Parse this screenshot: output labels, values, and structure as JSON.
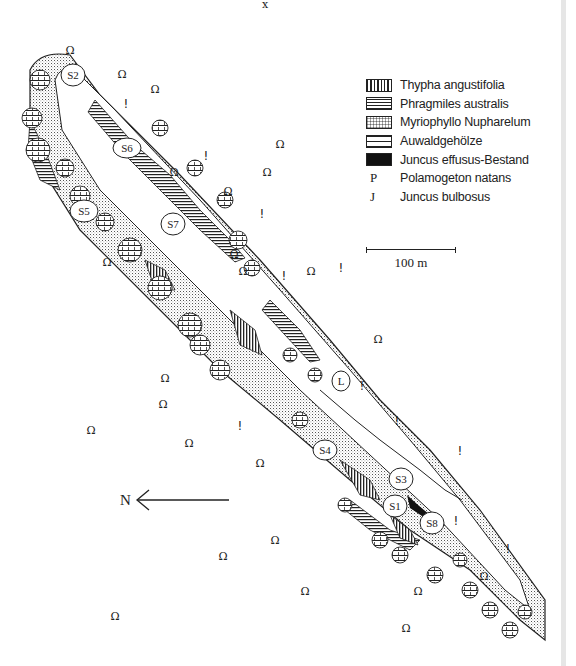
{
  "legend": {
    "items": [
      {
        "type": "pattern",
        "pattern": "vertical-hatch",
        "label": "Thypha angustifolia"
      },
      {
        "type": "pattern",
        "pattern": "horizontal-hatch",
        "label": "Phragmiles australis"
      },
      {
        "type": "pattern",
        "pattern": "fine-dots",
        "label": "Myriophyllo Nupharelum"
      },
      {
        "type": "pattern",
        "pattern": "wide-horizontal",
        "label": "Auwaldgehölze"
      },
      {
        "type": "pattern",
        "pattern": "solid-black",
        "label": "Juncus effusus-Bestand"
      },
      {
        "type": "symbol",
        "symbol": "P",
        "label": "Polamogeton natans"
      },
      {
        "type": "symbol",
        "symbol": "J",
        "label": "Juncus bulbosus"
      }
    ]
  },
  "scale": {
    "label": "100 m"
  },
  "north_arrow": {
    "label": "N"
  },
  "sites": [
    {
      "id": "S2",
      "x": 73,
      "y": 75
    },
    {
      "id": "S6",
      "x": 127,
      "y": 148
    },
    {
      "id": "S5",
      "x": 84,
      "y": 211
    },
    {
      "id": "S7",
      "x": 173,
      "y": 224
    },
    {
      "id": "L",
      "x": 341,
      "y": 381
    },
    {
      "id": "S4",
      "x": 325,
      "y": 450
    },
    {
      "id": "S3",
      "x": 401,
      "y": 479
    },
    {
      "id": "S1",
      "x": 395,
      "y": 506
    },
    {
      "id": "S8",
      "x": 432,
      "y": 523
    }
  ],
  "colors": {
    "ink": "#222222",
    "background": "#ffffff"
  }
}
